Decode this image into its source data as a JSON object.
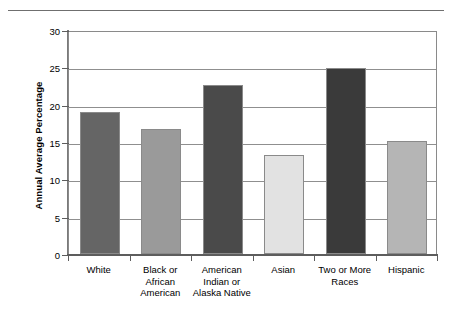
{
  "chart_data": {
    "type": "bar",
    "title": "",
    "xlabel": "",
    "ylabel": "Annual Average Percentage",
    "ylim": [
      0,
      30
    ],
    "yticks": [
      0,
      5,
      10,
      15,
      20,
      25,
      30
    ],
    "ytick_labels": [
      "0",
      "5",
      "10",
      "15",
      "20",
      "25",
      "30"
    ],
    "grid": "horizontal",
    "legend": "none",
    "categories": [
      "White",
      "Black or\nAfrican\nAmerican",
      "American\nIndian or\nAlaska Native",
      "Asian",
      "Two or More\nRaces",
      "Hispanic"
    ],
    "values": [
      19.0,
      16.7,
      22.7,
      13.2,
      24.9,
      15.1
    ],
    "bar_colors": [
      "#656565",
      "#9a9a9a",
      "#4a4a4a",
      "#e2e2e2",
      "#3a3a3a",
      "#b5b5b5"
    ],
    "bars": [
      {
        "label": "White",
        "value": 19.0,
        "color": "#656565"
      },
      {
        "label": "Black or\nAfrican\nAmerican",
        "value": 16.7,
        "color": "#9a9a9a"
      },
      {
        "label": "American\nIndian or\nAlaska Native",
        "value": 22.7,
        "color": "#4a4a4a"
      },
      {
        "label": "Asian",
        "value": 13.2,
        "color": "#e2e2e2"
      },
      {
        "label": "Two or More\nRaces",
        "value": 24.9,
        "color": "#3a3a3a"
      },
      {
        "label": "Hispanic",
        "value": 15.1,
        "color": "#b5b5b5"
      }
    ]
  },
  "axis": {
    "y_title": "Annual Average Percentage"
  }
}
